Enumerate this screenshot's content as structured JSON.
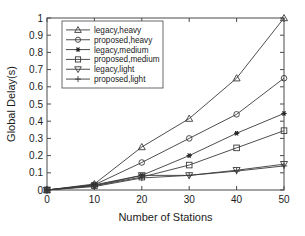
{
  "chart_data": {
    "type": "line",
    "title": "",
    "xlabel": "Number of Stations",
    "ylabel": "Global Delay(s)",
    "x": [
      0,
      10,
      20,
      30,
      40,
      50
    ],
    "xlim": [
      0,
      50
    ],
    "ylim": [
      0,
      1
    ],
    "xticks": [
      "0",
      "10",
      "20",
      "30",
      "40",
      "50"
    ],
    "yticks": [
      "0",
      "0.1",
      "0.2",
      "0.3",
      "0.4",
      "0.5",
      "0.6",
      "0.7",
      "0.8",
      "0.9",
      "1"
    ],
    "grid": false,
    "legend_position": "upper-left",
    "series": [
      {
        "name": "legacy,heavy",
        "marker": "triangle-up",
        "filled": false,
        "values": [
          0.0,
          0.035,
          0.25,
          0.415,
          0.65,
          1.0
        ]
      },
      {
        "name": "proposed,heavy",
        "marker": "circle",
        "filled": false,
        "values": [
          0.0,
          0.03,
          0.16,
          0.3,
          0.44,
          0.65
        ]
      },
      {
        "name": "legacy,medium",
        "marker": "star",
        "filled": true,
        "values": [
          0.0,
          0.03,
          0.085,
          0.2,
          0.33,
          0.445
        ]
      },
      {
        "name": "proposed,medium",
        "marker": "square",
        "filled": false,
        "values": [
          0.0,
          0.025,
          0.075,
          0.145,
          0.245,
          0.345
        ]
      },
      {
        "name": "legacy,light",
        "marker": "triangle-down",
        "filled": false,
        "values": [
          0.0,
          0.025,
          0.085,
          0.085,
          0.115,
          0.15
        ]
      },
      {
        "name": "proposed,light",
        "marker": "plus",
        "filled": false,
        "values": [
          0.0,
          0.02,
          0.07,
          0.085,
          0.11,
          0.14
        ]
      }
    ]
  },
  "colors": {
    "line": "#3a3a3a",
    "axis": "#4a4a4a",
    "text": "#1a1a1a",
    "background": "#ffffff"
  }
}
